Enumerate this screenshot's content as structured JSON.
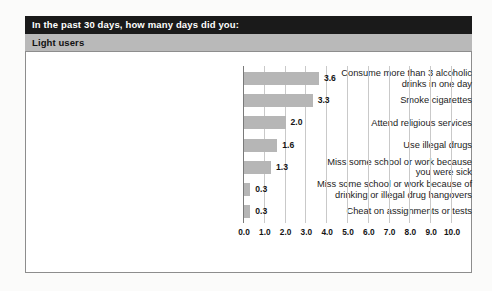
{
  "header": {
    "title_prefix": "In the past 30 days, how many ",
    "title_emphasis": "days",
    "title_suffix": " did you:",
    "subtitle": "Light users",
    "bar_color": "#1a1a1a",
    "subtitle_bar_color": "#b9b9b9"
  },
  "chart_data": {
    "type": "bar",
    "orientation": "horizontal",
    "title": "In the past 30 days, how many days did you:",
    "subtitle": "Light users",
    "xlabel": "",
    "ylabel": "",
    "xlim": [
      0,
      10
    ],
    "grid": true,
    "legend": "none",
    "bar_color": "#b6b6b6",
    "categories": [
      "Consume more than 3 alcoholic\ndrinks in one day",
      "Smoke cigarettes",
      "Attend religious services",
      "Use illegal drugs",
      "Miss some school or work because\nyou were sick",
      "Miss some school or work because of\ndrinking or illegal drug hangovers",
      "Cheat on assignments or tests"
    ],
    "values": [
      3.6,
      3.3,
      2.0,
      1.6,
      1.3,
      0.3,
      0.3
    ],
    "value_labels": [
      "3.6",
      "3.3",
      "2.0",
      "1.6",
      "1.3",
      "0.3",
      "0.3"
    ],
    "xticks": [
      0,
      1,
      2,
      3,
      4,
      5,
      6,
      7,
      8,
      9,
      10
    ],
    "xtick_labels": [
      "0.0",
      "1.0",
      "2.0",
      "3.0",
      "4.0",
      "5.0",
      "6.0",
      "7.0",
      "8.0",
      "9.0",
      "10.0"
    ]
  }
}
